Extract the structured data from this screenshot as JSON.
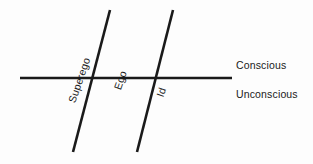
{
  "figure": {
    "background_color": "#fdfdfd",
    "stroke_color": "#1a1a1a",
    "text_color": "#1a1a1a"
  },
  "labels": {
    "conscious": "Conscious",
    "unconscious": "Unconscious",
    "superego": "Superego",
    "ego": "Ego",
    "id": "Id"
  },
  "geometry": {
    "horizontal_line": {
      "name": "consciousness-boundary",
      "x1": 20,
      "y1": 78,
      "x2": 232,
      "y2": 78,
      "stroke_width": 2.6
    },
    "diagonal_lines": [
      {
        "name": "superego-ego-divider",
        "x1": 110,
        "y1": 10,
        "x2": 73,
        "y2": 152,
        "stroke_width": 2.6
      },
      {
        "name": "ego-id-divider",
        "x1": 173,
        "y1": 10,
        "x2": 137,
        "y2": 152,
        "stroke_width": 2.6
      }
    ],
    "crossings": [
      {
        "name": "superego-boundary-crossing",
        "x": 92,
        "y": 78
      },
      {
        "name": "id-boundary-crossing",
        "x": 155,
        "y": 78
      }
    ]
  }
}
